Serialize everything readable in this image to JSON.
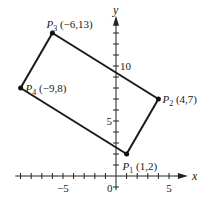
{
  "chart_data": {
    "type": "scatter",
    "title": "",
    "xlabel": "x",
    "ylabel": "y",
    "xlim": [
      -9.5,
      6.5
    ],
    "ylim": [
      -1.3,
      14.3
    ],
    "x_ticks": [
      -9,
      -8,
      -7,
      -6,
      -5,
      -4,
      -3,
      -2,
      -1,
      1,
      2,
      3,
      4,
      5
    ],
    "y_ticks": [
      -1,
      1,
      2,
      3,
      4,
      5,
      6,
      7,
      8,
      9,
      10,
      11,
      12,
      13
    ],
    "x_tick_labels": [
      {
        "value": -5,
        "label": "−5"
      },
      {
        "value": 0,
        "label": "0"
      },
      {
        "value": 5,
        "label": "5"
      }
    ],
    "y_tick_labels": [
      {
        "value": 5,
        "label": "5"
      },
      {
        "value": 10,
        "label": "10"
      }
    ],
    "grid": false,
    "points": [
      {
        "name": "P1",
        "sub": "1",
        "x": 1,
        "y": 2,
        "label": "(1,2)",
        "anchor": "below-right"
      },
      {
        "name": "P2",
        "sub": "2",
        "x": 4,
        "y": 7,
        "label": "(4,7)",
        "anchor": "right"
      },
      {
        "name": "P3",
        "sub": "3",
        "x": -6,
        "y": 13,
        "label": "(−6,13)",
        "anchor": "above-right"
      },
      {
        "name": "P4",
        "sub": "4",
        "x": -9,
        "y": 8,
        "label": "(−9,8)",
        "anchor": "right"
      }
    ],
    "polygon_order": [
      "P1",
      "P2",
      "P3",
      "P4"
    ]
  }
}
